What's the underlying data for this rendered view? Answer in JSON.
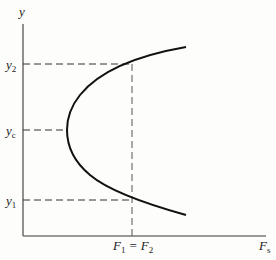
{
  "diagram": {
    "axes": {
      "y_label": "y",
      "x_label": "F",
      "x_label_sub": "s"
    },
    "levels": [
      {
        "name": "y2",
        "base": "y",
        "sub": "2"
      },
      {
        "name": "yc",
        "base": "y",
        "sub": "c"
      },
      {
        "name": "y1",
        "base": "y",
        "sub": "1"
      }
    ],
    "x_marker": {
      "lhs": "F",
      "lhs_sub": "1",
      "eq": "=",
      "rhs": "F",
      "rhs_sub": "2"
    },
    "colors": {
      "curve": "#111111",
      "axis": "#555555",
      "dash": "#333333"
    }
  }
}
